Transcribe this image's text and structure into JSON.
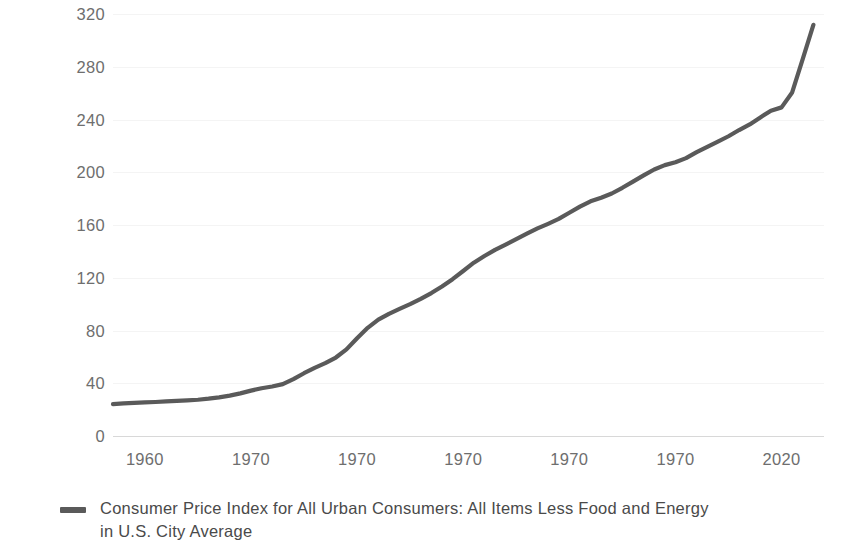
{
  "chart_data": {
    "type": "line",
    "title": "",
    "xlabel": "",
    "ylabel": "Index 1982-1984=100",
    "ylim": [
      0,
      320
    ],
    "yticks": [
      0,
      40,
      80,
      120,
      160,
      200,
      240,
      280,
      320
    ],
    "ytick_labels": [
      "0",
      "40",
      "80",
      "120",
      "160",
      "200",
      "240",
      "280",
      "320"
    ],
    "xlim": [
      1957,
      2024
    ],
    "xticks": [
      1960,
      1970,
      1980,
      1990,
      2000,
      2010,
      2020
    ],
    "xtick_labels": [
      "1960",
      "1970",
      "1970",
      "1970",
      "1970",
      "1970",
      "2020"
    ],
    "grid": true,
    "legend_position": "below",
    "series": [
      {
        "name": "Consumer Price Index for All Urban Consumers: All Items Less Food and Energy in U.S. City Average",
        "color": "#5a5a5a",
        "x": [
          1957,
          1958,
          1959,
          1960,
          1961,
          1962,
          1963,
          1964,
          1965,
          1966,
          1967,
          1968,
          1969,
          1970,
          1971,
          1972,
          1973,
          1974,
          1975,
          1976,
          1977,
          1978,
          1979,
          1980,
          1981,
          1982,
          1983,
          1984,
          1985,
          1986,
          1987,
          1988,
          1989,
          1990,
          1991,
          1992,
          1993,
          1994,
          1995,
          1996,
          1997,
          1998,
          1999,
          2000,
          2001,
          2002,
          2003,
          2004,
          2005,
          2006,
          2007,
          2008,
          2009,
          2010,
          2011,
          2012,
          2013,
          2014,
          2015,
          2016,
          2017,
          2018,
          2019,
          2020,
          2021,
          2022,
          2023
        ],
        "values": [
          24.2,
          24.8,
          25.1,
          25.5,
          25.8,
          26.2,
          26.6,
          27.0,
          27.5,
          28.3,
          29.3,
          30.6,
          32.3,
          34.4,
          36.2,
          37.5,
          39.3,
          43.1,
          47.6,
          51.6,
          55.2,
          59.5,
          65.7,
          74.1,
          82.0,
          88.2,
          92.6,
          96.4,
          100.0,
          104.0,
          108.4,
          113.4,
          118.9,
          125.1,
          131.4,
          136.5,
          141.1,
          145.2,
          149.3,
          153.4,
          157.4,
          160.9,
          164.6,
          169.3,
          173.9,
          178.0,
          180.7,
          183.9,
          188.2,
          192.9,
          197.6,
          202.1,
          205.4,
          207.6,
          210.7,
          215.2,
          219.3,
          223.2,
          227.3,
          232.0,
          236.3,
          241.6,
          246.7,
          249.2,
          260.5,
          286.0,
          311.8
        ],
        "start_value": 24.2,
        "end_value": 311.8
      }
    ]
  },
  "legend": {
    "marker": "line-swatch",
    "label": "Consumer Price Index for All Urban Consumers: All Items Less Food and Energy in U.S. City Average"
  },
  "colors": {
    "series": "#5a5a5a",
    "gridline": "#f4f4f4",
    "axis": "#d8d8d8",
    "tick_text": "#6e6e6e",
    "label_text": "#4a4a4a",
    "background": "#ffffff"
  }
}
